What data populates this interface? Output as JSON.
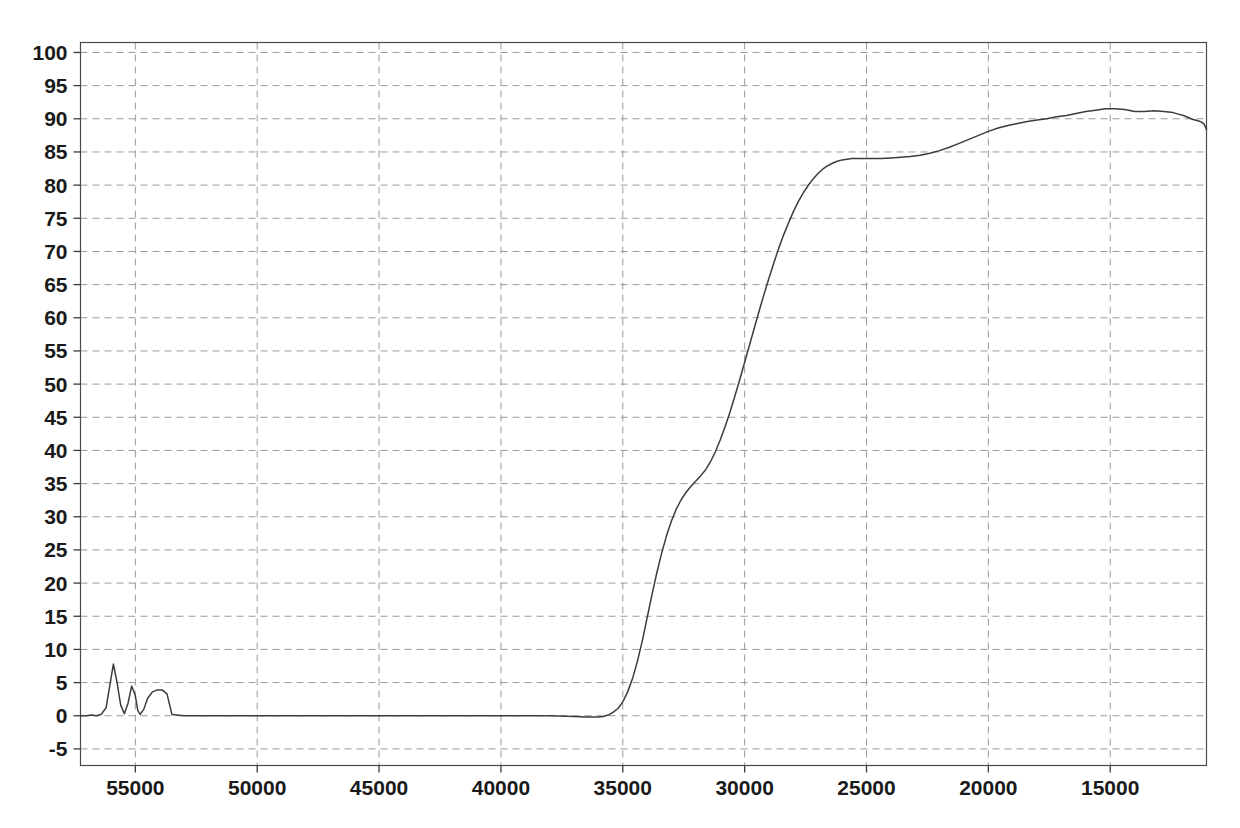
{
  "chart_data": {
    "type": "line",
    "title": "",
    "subtitle": "",
    "xlabel": "",
    "ylabel": "",
    "xlim": [
      57250,
      11050
    ],
    "ylim": [
      -7.5,
      101.5
    ],
    "x_reversed": true,
    "grid": true,
    "legend": "none",
    "x_ticks": [
      55000,
      50000,
      45000,
      40000,
      35000,
      30000,
      25000,
      20000,
      15000
    ],
    "x_tick_labels": [
      "55000",
      "50000",
      "45000",
      "40000",
      "35000",
      "30000",
      "25000",
      "20000",
      "15000"
    ],
    "y_ticks": [
      -5,
      0,
      5,
      10,
      15,
      20,
      25,
      30,
      35,
      40,
      45,
      50,
      55,
      60,
      65,
      70,
      75,
      80,
      85,
      90,
      95,
      100
    ],
    "y_tick_labels": [
      "-5",
      "0",
      "5",
      "10",
      "15",
      "20",
      "25",
      "30",
      "35",
      "40",
      "45",
      "50",
      "55",
      "60",
      "65",
      "70",
      "75",
      "80",
      "85",
      "90",
      "95",
      "100"
    ],
    "series": [
      {
        "name": "spectrum",
        "color": "#3c3c3c",
        "x": [
          57250,
          57000,
          56800,
          56600,
          56400,
          56200,
          56050,
          55900,
          55750,
          55600,
          55450,
          55300,
          55150,
          55000,
          54900,
          54800,
          54650,
          54500,
          54300,
          54100,
          53900,
          53700,
          53500,
          53000,
          52000,
          50000,
          48000,
          46000,
          44000,
          42000,
          40000,
          38000,
          37000,
          36500,
          36200,
          36000,
          35800,
          35600,
          35400,
          35200,
          35000,
          34800,
          34600,
          34400,
          34200,
          34000,
          33800,
          33600,
          33400,
          33200,
          33000,
          32800,
          32600,
          32400,
          32200,
          32000,
          31800,
          31600,
          31400,
          31200,
          31000,
          30800,
          30600,
          30400,
          30200,
          30000,
          29800,
          29600,
          29400,
          29200,
          29000,
          28800,
          28600,
          28400,
          28200,
          28000,
          27800,
          27600,
          27400,
          27200,
          27000,
          26800,
          26600,
          26400,
          26200,
          26000,
          25800,
          25600,
          25400,
          25200,
          25000,
          24700,
          24400,
          24000,
          23600,
          23200,
          22800,
          22400,
          22000,
          21600,
          21200,
          20800,
          20400,
          20000,
          19600,
          19200,
          18800,
          18400,
          18000,
          17600,
          17200,
          16800,
          16400,
          16000,
          15600,
          15200,
          14800,
          14400,
          14000,
          13600,
          13200,
          12800,
          12500,
          12200,
          12000,
          11800,
          11600,
          11400,
          11250,
          11150,
          11050
        ],
        "y": [
          0.0,
          0.0,
          0.1,
          0.0,
          0.2,
          1.2,
          4.5,
          7.8,
          5.0,
          1.6,
          0.3,
          1.9,
          4.5,
          3.0,
          0.8,
          0.2,
          1.0,
          2.6,
          3.6,
          3.9,
          3.9,
          3.3,
          0.2,
          0.0,
          0.0,
          0.0,
          0.0,
          0.0,
          0.0,
          0.0,
          0.0,
          0.0,
          -0.1,
          -0.2,
          -0.2,
          -0.2,
          -0.1,
          0.1,
          0.5,
          1.1,
          2.1,
          3.6,
          5.6,
          8.2,
          11.3,
          14.8,
          18.3,
          21.6,
          24.6,
          27.2,
          29.4,
          31.2,
          32.6,
          33.7,
          34.6,
          35.4,
          36.2,
          37.1,
          38.3,
          39.8,
          41.6,
          43.6,
          45.8,
          48.2,
          50.7,
          53.3,
          55.9,
          58.5,
          61.1,
          63.6,
          66.0,
          68.3,
          70.5,
          72.5,
          74.3,
          76.0,
          77.5,
          78.8,
          79.9,
          80.9,
          81.7,
          82.4,
          82.9,
          83.3,
          83.6,
          83.8,
          83.9,
          84.0,
          84.0,
          84.0,
          84.0,
          84.0,
          84.0,
          84.1,
          84.2,
          84.3,
          84.5,
          84.8,
          85.2,
          85.7,
          86.3,
          86.9,
          87.5,
          88.1,
          88.6,
          89.0,
          89.3,
          89.6,
          89.8,
          90.0,
          90.3,
          90.5,
          90.8,
          91.1,
          91.3,
          91.5,
          91.5,
          91.4,
          91.1,
          91.1,
          91.2,
          91.1,
          91.0,
          90.7,
          90.5,
          90.2,
          89.9,
          89.7,
          89.5,
          89.2,
          88.4
        ]
      }
    ],
    "annotations": []
  },
  "figure": {
    "background_color": "#ffffff",
    "plot_border_color": "#4a4a4a",
    "gridline_color": "#9a9a9a",
    "curve_color": "#3c3c3c",
    "tick_label_color": "#1a1a1a"
  }
}
